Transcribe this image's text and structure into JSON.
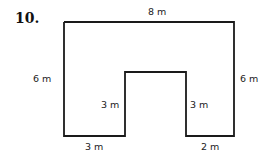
{
  "problem_number": "10.",
  "shape": {
    "type": "rectilinear polygon",
    "stroke_color": "#1a1a1a"
  },
  "labels": {
    "top": "8 m",
    "left": "6 m",
    "right": "6 m",
    "inner_left": "3 m",
    "inner_right": "3 m",
    "bottom_left": "3 m",
    "bottom_right": "2 m"
  }
}
